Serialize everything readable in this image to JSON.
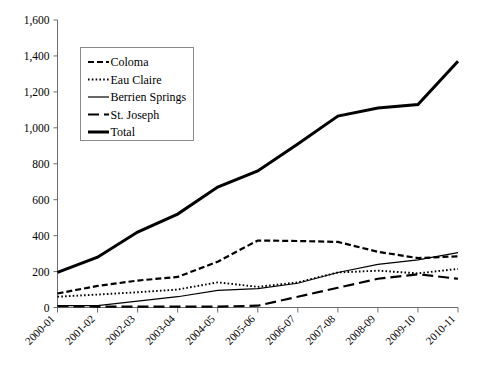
{
  "chart_data": {
    "type": "line",
    "title": "",
    "subtitle": "",
    "xlabel": "",
    "ylabel": "",
    "grid": false,
    "legend_position": "upper-left-inside",
    "categories": [
      "2000-01",
      "2001-02",
      "2002-03",
      "2003-04",
      "2004-05",
      "2005-06",
      "2006-07",
      "2007-08",
      "2008-09",
      "2009-10",
      "2010-11"
    ],
    "ylim": [
      0,
      1600
    ],
    "ytick_labels": [
      "0",
      "200",
      "400",
      "600",
      "800",
      "1,000",
      "1,200",
      "1,400",
      "1,600"
    ],
    "ytick_values": [
      0,
      200,
      400,
      600,
      800,
      1000,
      1200,
      1400,
      1600
    ],
    "series": [
      {
        "name": "Coloma",
        "style": "dashed",
        "values": [
          78,
          120,
          150,
          170,
          255,
          373,
          370,
          365,
          310,
          275,
          285
        ]
      },
      {
        "name": "Eau Claire",
        "style": "dotted",
        "values": [
          60,
          72,
          85,
          100,
          140,
          115,
          140,
          195,
          205,
          190,
          215
        ]
      },
      {
        "name": "Berrien Springs",
        "style": "solid-thin",
        "values": [
          10,
          10,
          35,
          60,
          95,
          105,
          135,
          195,
          240,
          265,
          305
        ]
      },
      {
        "name": "St. Joseph",
        "style": "long-dash",
        "values": [
          8,
          5,
          5,
          5,
          5,
          10,
          60,
          110,
          160,
          185,
          160
        ]
      },
      {
        "name": "Total",
        "style": "solid-thick",
        "values": [
          195,
          280,
          420,
          520,
          670,
          760,
          910,
          1065,
          1110,
          1130,
          1370
        ]
      }
    ]
  },
  "legend": {
    "items": [
      {
        "label": "Coloma",
        "swatch": "dashed-line-swatch"
      },
      {
        "label": "Eau Claire",
        "swatch": "dotted-line-swatch"
      },
      {
        "label": "Berrien Springs",
        "swatch": "thin-solid-line-swatch"
      },
      {
        "label": "St. Joseph",
        "swatch": "long-dash-line-swatch"
      },
      {
        "label": "Total",
        "swatch": "thick-solid-line-swatch"
      }
    ]
  }
}
